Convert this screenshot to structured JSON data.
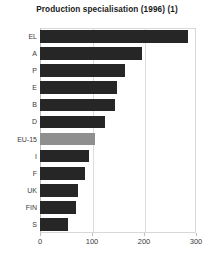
{
  "chart_data": {
    "type": "bar",
    "orientation": "horizontal",
    "title": "Production specialisation (1996) (1)",
    "xlabel": "",
    "ylabel": "",
    "categories": [
      "EL",
      "A",
      "P",
      "E",
      "B",
      "D",
      "EU-15",
      "I",
      "F",
      "UK",
      "FIN",
      "S"
    ],
    "values": [
      285,
      196,
      163,
      148,
      144,
      125,
      105,
      94,
      87,
      73,
      70,
      54
    ],
    "xlim": [
      0,
      300
    ],
    "xticks": [
      0,
      100,
      200,
      300
    ],
    "xtick_labels": [
      "0",
      "100",
      "200",
      "300"
    ],
    "grid": true,
    "grid_axis": "x",
    "legend": null,
    "bar_color": "#262626",
    "highlight_category": "EU-15",
    "highlight_color": "#8f8f8f",
    "bars": [
      {
        "label": "EL",
        "value": 285,
        "highlight": false
      },
      {
        "label": "A",
        "value": 196,
        "highlight": false
      },
      {
        "label": "P",
        "value": 163,
        "highlight": false
      },
      {
        "label": "E",
        "value": 148,
        "highlight": false
      },
      {
        "label": "B",
        "value": 144,
        "highlight": false
      },
      {
        "label": "D",
        "value": 125,
        "highlight": false
      },
      {
        "label": "EU-15",
        "value": 105,
        "highlight": true
      },
      {
        "label": "I",
        "value": 94,
        "highlight": false
      },
      {
        "label": "F",
        "value": 87,
        "highlight": false
      },
      {
        "label": "UK",
        "value": 73,
        "highlight": false
      },
      {
        "label": "FIN",
        "value": 70,
        "highlight": false
      },
      {
        "label": "S",
        "value": 54,
        "highlight": false
      }
    ]
  }
}
